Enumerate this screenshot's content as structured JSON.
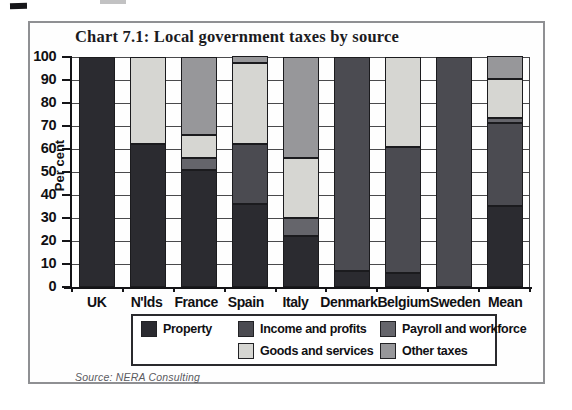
{
  "title": "Chart 7.1: Local government taxes by source",
  "source_note": "Source: NERA Consulting",
  "chart_data": {
    "type": "bar",
    "stacked": true,
    "title": "Chart 7.1: Local government taxes by source",
    "xlabel": "",
    "ylabel": "Per cent",
    "ylim": [
      0,
      100
    ],
    "ytick_step": 10,
    "yticks": [
      0,
      10,
      20,
      30,
      40,
      50,
      60,
      70,
      80,
      90,
      100
    ],
    "grid": true,
    "legend_position": "bottom",
    "categories": [
      "UK",
      "N'lds",
      "France",
      "Spain",
      "Italy",
      "Denmark",
      "Belgium",
      "Sweden",
      "Mean"
    ],
    "series": [
      {
        "name": "Property",
        "color": "#2b2b30",
        "values": [
          100,
          62,
          51,
          36,
          22,
          7,
          6,
          0,
          35
        ]
      },
      {
        "name": "Income and profits",
        "color": "#4b4b51",
        "values": [
          0,
          0,
          0,
          26,
          0,
          93,
          55,
          100,
          36
        ]
      },
      {
        "name": "Payroll and workforce",
        "color": "#65656b",
        "values": [
          0,
          0,
          5,
          0,
          8,
          0,
          0,
          0,
          2
        ]
      },
      {
        "name": "Goods and services",
        "color": "#d6d6d2",
        "values": [
          0,
          38,
          10,
          35,
          26,
          0,
          39,
          0,
          17
        ]
      },
      {
        "name": "Other taxes",
        "color": "#97979a",
        "values": [
          0,
          0,
          34,
          3,
          44,
          0,
          0,
          0,
          10
        ]
      }
    ],
    "legend_rows": [
      [
        "Property",
        "Income and profits",
        "Payroll and workforce"
      ],
      [
        "",
        "Goods and services",
        "Other taxes"
      ]
    ]
  }
}
